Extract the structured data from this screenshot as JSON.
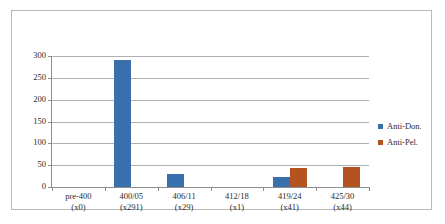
{
  "figure": {
    "background_color": "#ffffff",
    "border_color": "#b9b9b9"
  },
  "legend": {
    "position": "right",
    "entries": [
      {
        "label": "Anti-Don.",
        "color": "#3a6fad"
      },
      {
        "label": "Anti-Pel.",
        "color": "#b4531f"
      }
    ]
  },
  "chart_data": {
    "type": "bar",
    "title": "",
    "xlabel": "",
    "ylabel": "",
    "ylim": [
      0,
      300
    ],
    "yticks": [
      0,
      50,
      100,
      150,
      200,
      250,
      300
    ],
    "ytick_labels": [
      "0",
      "50",
      "100",
      "150",
      "200",
      "250",
      "300"
    ],
    "grid": true,
    "grid_axis": "y",
    "legend_position": "right",
    "categories": [
      "pre-400",
      "400/05",
      "406/11",
      "412/18",
      "419/24",
      "425/30"
    ],
    "category_sublabels": [
      "(x0)",
      "(x291)",
      "(x29)",
      "(x1)",
      "(x41)",
      "(x44)"
    ],
    "series": [
      {
        "name": "Anti-Don.",
        "color": "#3a6fad",
        "values": [
          0,
          291,
          29,
          0,
          22,
          0
        ]
      },
      {
        "name": "Anti-Pel.",
        "color": "#b4531f",
        "values": [
          0,
          0,
          0,
          0,
          43,
          45
        ]
      }
    ]
  }
}
